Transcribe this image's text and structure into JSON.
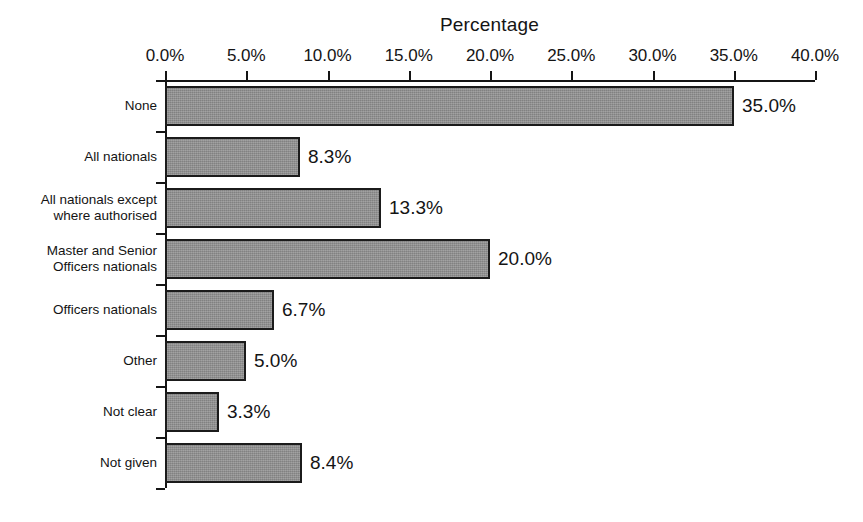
{
  "chart_data": {
    "type": "bar",
    "orientation": "horizontal",
    "title": "Percentage",
    "xlabel": "Percentage",
    "ylabel": "",
    "categories": [
      "None",
      "All nationals",
      "All nationals except\nwhere authorised",
      "Master and Senior\nOfficers nationals",
      "Officers nationals",
      "Other",
      "Not clear",
      "Not given"
    ],
    "values": [
      35.0,
      8.3,
      13.3,
      20.0,
      6.7,
      5.0,
      3.3,
      8.4
    ],
    "value_labels": [
      "35.0%",
      "8.3%",
      "13.3%",
      "20.0%",
      "6.7%",
      "5.0%",
      "3.3%",
      "8.4%"
    ],
    "xlim": [
      0,
      40
    ],
    "xticks": [
      0,
      5,
      10,
      15,
      20,
      25,
      30,
      35,
      40
    ],
    "xtick_labels": [
      "0.0%",
      "5.0%",
      "10.0%",
      "15.0%",
      "20.0%",
      "25.0%",
      "30.0%",
      "35.0%",
      "40.0%"
    ],
    "grid": false,
    "legend": false,
    "axis_position": "top",
    "bar_color": "#8e8e8e",
    "bar_edge_color": "#1b1b1b",
    "axis_color": "#151515",
    "text_color": "#141414",
    "background_color": "#ffffff"
  }
}
